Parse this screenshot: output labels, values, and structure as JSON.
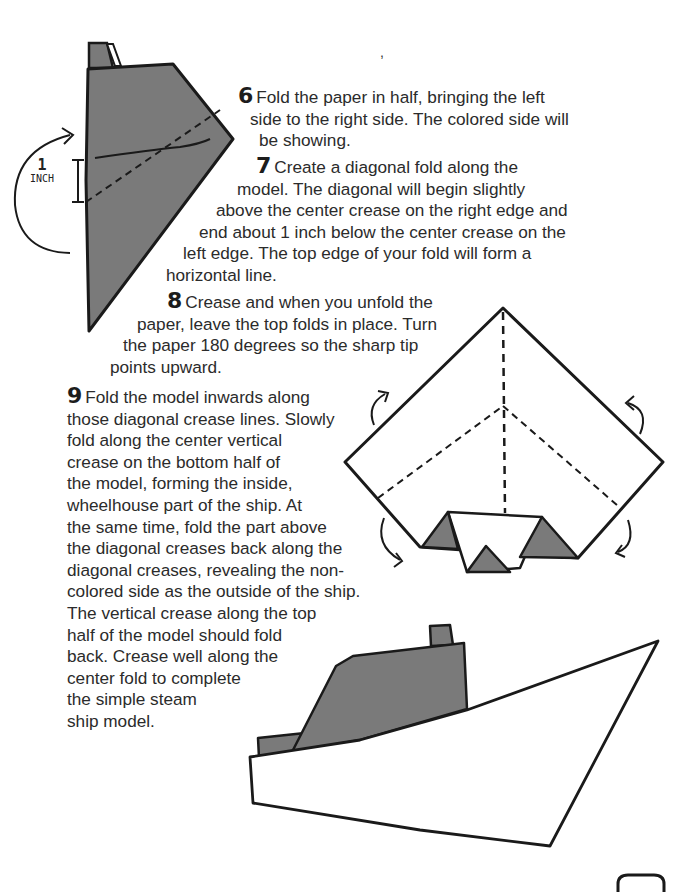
{
  "page": {
    "stray_mark": ","
  },
  "steps": [
    {
      "number": "6",
      "lines": [
        "Fold the paper in half, bringing the left",
        "side to the right side. The colored side will",
        "be showing."
      ]
    },
    {
      "number": "7",
      "lines": [
        "Create a diagonal fold along the",
        "model. The diagonal will begin slightly",
        "above the center crease on the right edge and",
        "end about 1 inch below the center crease on the",
        "left edge. The top edge of your fold will form a",
        "horizontal line."
      ]
    },
    {
      "number": "8",
      "lines": [
        "Crease and when you unfold the",
        "paper, leave the top folds in place. Turn",
        "the paper 180 degrees so the sharp tip",
        "points upward."
      ]
    },
    {
      "number": "9",
      "lines": [
        "Fold the model inwards along",
        "those diagonal crease lines. Slowly",
        "fold along the center vertical",
        "crease on the bottom half of",
        "the model, forming the inside,",
        "wheelhouse part of the ship. At",
        "the same time, fold the part above",
        "the diagonal creases back along the",
        "diagonal creases, revealing the non-",
        "colored side as the outside of the ship.",
        "The vertical crease along the top",
        "half of the model should fold",
        "back. Crease well along the",
        "center fold to complete",
        "the simple steam",
        "ship model."
      ]
    }
  ],
  "figures": {
    "step7_diagram": {
      "measure_value": "1",
      "measure_unit": "INCH"
    },
    "step8_diagram": {},
    "finished_ship": {}
  },
  "colors": {
    "paper_colored": "#7a7a7a",
    "ink": "#1a1a1a",
    "background": "#ffffff"
  }
}
